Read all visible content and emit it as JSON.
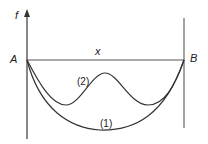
{
  "diagram": {
    "axis_label": "f",
    "horizontal_label": "x",
    "left_point_label": "A",
    "right_point_label": "B",
    "curves": [
      {
        "id": "1",
        "label": "(1)",
        "shape": "single smooth U-shaped sag from A to B"
      },
      {
        "id": "2",
        "label": "(2)",
        "shape": "double-dip curve with central hump between A and B"
      }
    ],
    "colors": {
      "line": "#555555",
      "curve": "#333333",
      "text": "#222222"
    }
  }
}
